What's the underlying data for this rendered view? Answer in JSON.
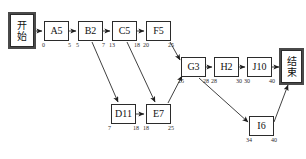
{
  "diagram": {
    "type": "activity-network-pert-cpm",
    "nodes": [
      {
        "id": "start",
        "label": "开始",
        "kind": "terminal",
        "x": 10,
        "y": 14,
        "w": 24,
        "h": 33,
        "es": null,
        "ef": null
      },
      {
        "id": "A5",
        "label": "A5",
        "kind": "task",
        "x": 44,
        "y": 21,
        "w": 25,
        "h": 20,
        "es": "0",
        "ef": "5"
      },
      {
        "id": "B2",
        "label": "B2",
        "kind": "task",
        "x": 78,
        "y": 21,
        "w": 25,
        "h": 20,
        "es": "5",
        "ef": "7"
      },
      {
        "id": "C5",
        "label": "C5",
        "kind": "task",
        "x": 112,
        "y": 21,
        "w": 25,
        "h": 20,
        "es": "13",
        "ef": "18"
      },
      {
        "id": "F5",
        "label": "F5",
        "kind": "task",
        "x": 146,
        "y": 21,
        "w": 25,
        "h": 20,
        "es": "20",
        "ef": "25"
      },
      {
        "id": "D11",
        "label": "D11",
        "kind": "task",
        "x": 111,
        "y": 104,
        "w": 25,
        "h": 20,
        "es": "7",
        "ef": "18"
      },
      {
        "id": "E7",
        "label": "E7",
        "kind": "task",
        "x": 146,
        "y": 104,
        "w": 25,
        "h": 20,
        "es": "18",
        "ef": "25"
      },
      {
        "id": "G3",
        "label": "G3",
        "kind": "task",
        "x": 181,
        "y": 57,
        "w": 25,
        "h": 20,
        "es": "25",
        "ef": "28"
      },
      {
        "id": "H2",
        "label": "H2",
        "kind": "task",
        "x": 214,
        "y": 57,
        "w": 25,
        "h": 20,
        "es": "28",
        "ef": "30"
      },
      {
        "id": "J10",
        "label": "J10",
        "kind": "task",
        "x": 247,
        "y": 57,
        "w": 25,
        "h": 20,
        "es": "30",
        "ef": "40"
      },
      {
        "id": "I6",
        "label": "I6",
        "kind": "task",
        "x": 249,
        "y": 116,
        "w": 25,
        "h": 20,
        "es": "34",
        "ef": "40"
      },
      {
        "id": "end",
        "label": "结束",
        "kind": "terminal",
        "x": 281,
        "y": 50,
        "w": 21,
        "h": 33,
        "es": null,
        "ef": null
      }
    ],
    "edges": [
      {
        "from": "start",
        "to": "A5",
        "style": "straight"
      },
      {
        "from": "A5",
        "to": "B2",
        "style": "straight"
      },
      {
        "from": "B2",
        "to": "C5",
        "style": "straight"
      },
      {
        "from": "C5",
        "to": "F5",
        "style": "straight"
      },
      {
        "from": "B2",
        "to": "D11",
        "style": "diagonal"
      },
      {
        "from": "C5",
        "to": "E7",
        "style": "diagonal"
      },
      {
        "from": "D11",
        "to": "E7",
        "style": "straight"
      },
      {
        "from": "F5",
        "to": "G3",
        "style": "diagonal"
      },
      {
        "from": "E7",
        "to": "G3",
        "style": "diagonal"
      },
      {
        "from": "G3",
        "to": "H2",
        "style": "straight"
      },
      {
        "from": "H2",
        "to": "J10",
        "style": "straight"
      },
      {
        "from": "J10",
        "to": "end",
        "style": "straight"
      },
      {
        "from": "G3",
        "to": "I6",
        "style": "diagonal"
      },
      {
        "from": "I6",
        "to": "end",
        "style": "diagonal"
      }
    ],
    "colors": {
      "stroke": "#2b2b2b",
      "background": "#ffffff",
      "text": "#111111"
    }
  }
}
